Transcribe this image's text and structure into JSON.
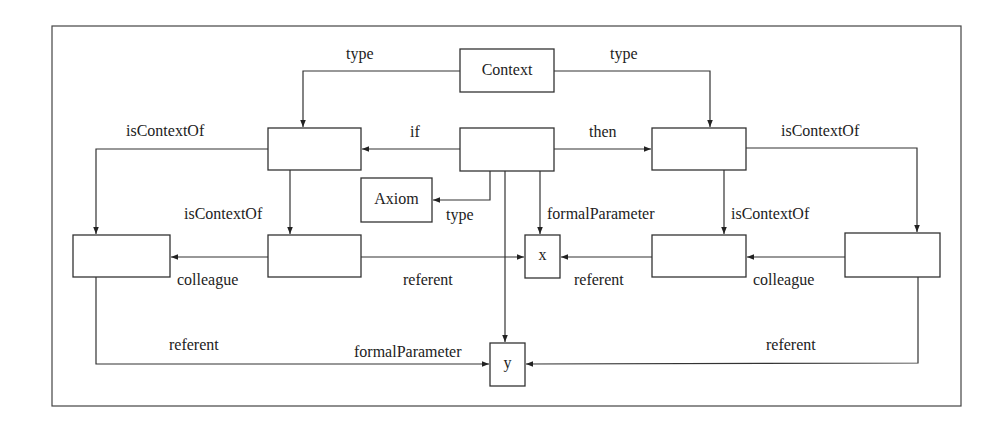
{
  "diagram": {
    "colors": {
      "stroke": "#333333",
      "text": "#222222",
      "background": "#ffffff"
    },
    "nodes": {
      "context": {
        "label": "Context"
      },
      "if_context": {
        "label": ""
      },
      "rule": {
        "label": ""
      },
      "then_context": {
        "label": ""
      },
      "axiom": {
        "label": "Axiom"
      },
      "if_colleague": {
        "label": ""
      },
      "if_inner": {
        "label": ""
      },
      "x": {
        "label": "x"
      },
      "then_inner": {
        "label": ""
      },
      "then_colleague": {
        "label": ""
      },
      "y": {
        "label": "y"
      }
    },
    "edges": {
      "type_left": "type",
      "type_right": "type",
      "if": "if",
      "then": "then",
      "isContextOf_left_outer": "isContextOf",
      "isContextOf_right_outer": "isContextOf",
      "isContextOf_left_inner": "isContextOf",
      "isContextOf_right_inner": "isContextOf",
      "type_axiom": "type",
      "formalParameter_x": "formalParameter",
      "formalParameter_y": "formalParameter",
      "colleague_left": "colleague",
      "colleague_right": "colleague",
      "referent_left_x": "referent",
      "referent_right_x": "referent",
      "referent_left_y": "referent",
      "referent_right_y": "referent"
    }
  }
}
